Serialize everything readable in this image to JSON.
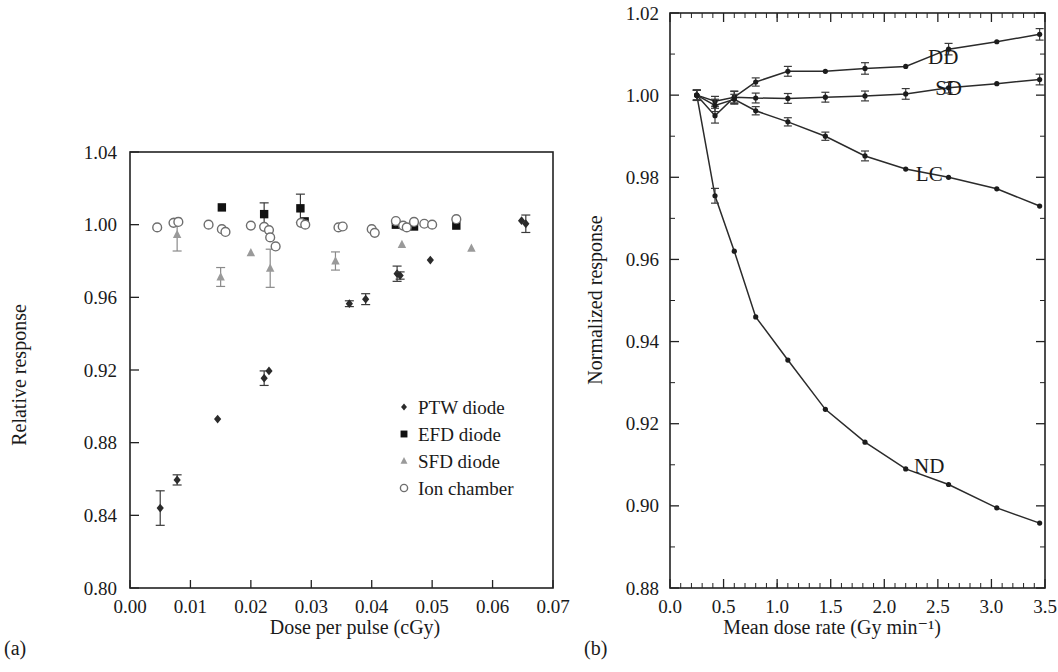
{
  "figure": {
    "panel_a_label": "(a)",
    "panel_b_label": "(b)"
  },
  "chart_data": [
    {
      "id": "panel-a",
      "type": "scatter",
      "title": "",
      "xlabel": "Dose per pulse (cGy)",
      "ylabel": "Relative response",
      "xlim": [
        0.0,
        0.07
      ],
      "ylim": [
        0.8,
        1.04
      ],
      "xticks": [
        0.0,
        0.01,
        0.02,
        0.03,
        0.04,
        0.05,
        0.06,
        0.07
      ],
      "xtick_labels": [
        "0.00",
        "0.01",
        "0.02",
        "0.03",
        "0.04",
        "0.05",
        "0.06",
        "0.07"
      ],
      "yticks": [
        0.8,
        0.84,
        0.88,
        0.92,
        0.96,
        1.0,
        1.04
      ],
      "ytick_labels": [
        "0.80",
        "0.84",
        "0.88",
        "0.92",
        "0.96",
        "1.00",
        "1.04"
      ],
      "grid": false,
      "legend_position": "inside lower-right",
      "legend": [
        {
          "label": "PTW diode",
          "marker": "filled-diamond",
          "color": "#2b2b2b"
        },
        {
          "label": "EFD diode",
          "marker": "filled-square",
          "color": "#111111"
        },
        {
          "label": "SFD diode",
          "marker": "filled-triangle",
          "color": "#9a9a9a"
        },
        {
          "label": "Ion chamber",
          "marker": "open-circle",
          "color": "#6e6e6e"
        }
      ],
      "series": [
        {
          "name": "PTW diode",
          "marker": "filled-diamond",
          "color": "#2b2b2b",
          "points": [
            {
              "x": 0.005,
              "y": 0.844,
              "yerr": 0.0095
            },
            {
              "x": 0.0078,
              "y": 0.8595,
              "yerr": 0.0028
            },
            {
              "x": 0.0145,
              "y": 0.893,
              "yerr": 0.0
            },
            {
              "x": 0.0222,
              "y": 0.9155,
              "yerr": 0.004
            },
            {
              "x": 0.023,
              "y": 0.9195,
              "yerr": 0.0
            },
            {
              "x": 0.0363,
              "y": 0.9565,
              "yerr": 0.0016
            },
            {
              "x": 0.039,
              "y": 0.959,
              "yerr": 0.003
            },
            {
              "x": 0.0442,
              "y": 0.973,
              "yerr": 0.0042
            },
            {
              "x": 0.0447,
              "y": 0.972,
              "yerr": 0.002
            },
            {
              "x": 0.0497,
              "y": 0.9805,
              "yerr": 0.0
            },
            {
              "x": 0.0648,
              "y": 1.0022,
              "yerr": 0.0
            },
            {
              "x": 0.0655,
              "y": 1.0005,
              "yerr": 0.0048
            }
          ]
        },
        {
          "name": "EFD diode",
          "marker": "filled-square",
          "color": "#111111",
          "points": [
            {
              "x": 0.0152,
              "y": 1.0095,
              "yerr": 0.0
            },
            {
              "x": 0.0222,
              "y": 1.0058,
              "yerr": 0.0062
            },
            {
              "x": 0.0282,
              "y": 1.009,
              "yerr": 0.0078
            },
            {
              "x": 0.0289,
              "y": 1.0018,
              "yerr": 0.0
            },
            {
              "x": 0.044,
              "y": 1.0,
              "yerr": 0.0
            },
            {
              "x": 0.047,
              "y": 0.999,
              "yerr": 0.0
            },
            {
              "x": 0.054,
              "y": 0.9995,
              "yerr": 0.0
            }
          ]
        },
        {
          "name": "SFD diode",
          "marker": "filled-triangle",
          "color": "#9a9a9a",
          "points": [
            {
              "x": 0.0078,
              "y": 0.9945,
              "yerr": 0.009
            },
            {
              "x": 0.015,
              "y": 0.9712,
              "yerr": 0.0052
            },
            {
              "x": 0.02,
              "y": 0.9845,
              "yerr": 0.0
            },
            {
              "x": 0.0232,
              "y": 0.976,
              "yerr": 0.0105
            },
            {
              "x": 0.034,
              "y": 0.98,
              "yerr": 0.005
            },
            {
              "x": 0.045,
              "y": 0.989,
              "yerr": 0.0
            },
            {
              "x": 0.0565,
              "y": 0.987,
              "yerr": 0.0
            }
          ]
        },
        {
          "name": "Ion chamber",
          "marker": "open-circle",
          "color": "#6e6e6e",
          "points": [
            {
              "x": 0.0045,
              "y": 0.9985,
              "yerr": 0.0
            },
            {
              "x": 0.0072,
              "y": 1.001,
              "yerr": 0.0
            },
            {
              "x": 0.008,
              "y": 1.0015,
              "yerr": 0.0
            },
            {
              "x": 0.013,
              "y": 1.0,
              "yerr": 0.0
            },
            {
              "x": 0.0152,
              "y": 0.9975,
              "yerr": 0.0
            },
            {
              "x": 0.0158,
              "y": 0.996,
              "yerr": 0.0
            },
            {
              "x": 0.02,
              "y": 0.9995,
              "yerr": 0.0
            },
            {
              "x": 0.0222,
              "y": 0.9988,
              "yerr": 0.0
            },
            {
              "x": 0.023,
              "y": 0.997,
              "yerr": 0.0
            },
            {
              "x": 0.0232,
              "y": 0.993,
              "yerr": 0.0
            },
            {
              "x": 0.0241,
              "y": 0.988,
              "yerr": 0.0
            },
            {
              "x": 0.0283,
              "y": 1.001,
              "yerr": 0.0
            },
            {
              "x": 0.029,
              "y": 1.0,
              "yerr": 0.0
            },
            {
              "x": 0.0345,
              "y": 0.9985,
              "yerr": 0.0
            },
            {
              "x": 0.0352,
              "y": 0.999,
              "yerr": 0.0
            },
            {
              "x": 0.04,
              "y": 0.9975,
              "yerr": 0.0
            },
            {
              "x": 0.0405,
              "y": 0.9955,
              "yerr": 0.0
            },
            {
              "x": 0.044,
              "y": 1.002,
              "yerr": 0.0
            },
            {
              "x": 0.0452,
              "y": 0.9995,
              "yerr": 0.0
            },
            {
              "x": 0.0458,
              "y": 0.9985,
              "yerr": 0.0
            },
            {
              "x": 0.047,
              "y": 1.0015,
              "yerr": 0.0
            },
            {
              "x": 0.0487,
              "y": 1.0005,
              "yerr": 0.0
            },
            {
              "x": 0.05,
              "y": 1.0,
              "yerr": 0.0
            },
            {
              "x": 0.054,
              "y": 1.003,
              "yerr": 0.0
            }
          ]
        }
      ]
    },
    {
      "id": "panel-b",
      "type": "line",
      "title": "",
      "xlabel": "Mean dose rate (Gy min⁻¹)",
      "ylabel": "Normalized response",
      "xlim": [
        0.0,
        3.5
      ],
      "ylim": [
        0.88,
        1.02
      ],
      "xticks": [
        0.0,
        0.5,
        1.0,
        1.5,
        2.0,
        2.5,
        3.0,
        3.5
      ],
      "xtick_labels": [
        "0.0",
        "0.5",
        "1.0",
        "1.5",
        "2.0",
        "2.5",
        "3.0",
        "3.5"
      ],
      "yticks": [
        0.88,
        0.9,
        0.92,
        0.94,
        0.96,
        0.98,
        1.0,
        1.02
      ],
      "ytick_labels": [
        "0.88",
        "0.90",
        "0.92",
        "0.94",
        "0.96",
        "0.98",
        "1.00",
        "1.02"
      ],
      "grid": false,
      "legend_position": "inline annotations",
      "series": [
        {
          "name": "DD",
          "label": "DD",
          "label_x": 2.55,
          "label_y": 1.0075,
          "points": [
            {
              "x": 0.25,
              "y": 1.0,
              "yerr": 0.0012
            },
            {
              "x": 0.42,
              "y": 0.995,
              "yerr": 0.0018
            },
            {
              "x": 0.6,
              "y": 0.9995,
              "yerr": 0.0015
            },
            {
              "x": 0.8,
              "y": 1.0032,
              "yerr": 0.001
            },
            {
              "x": 1.1,
              "y": 1.0058,
              "yerr": 0.0012
            },
            {
              "x": 1.45,
              "y": 1.0058,
              "yerr": 0.0
            },
            {
              "x": 1.82,
              "y": 1.0065,
              "yerr": 0.0014
            },
            {
              "x": 2.2,
              "y": 1.007,
              "yerr": 0.0
            },
            {
              "x": 2.6,
              "y": 1.0112,
              "yerr": 0.0014
            },
            {
              "x": 3.05,
              "y": 1.013,
              "yerr": 0.0
            },
            {
              "x": 3.45,
              "y": 1.0148,
              "yerr": 0.0014
            }
          ]
        },
        {
          "name": "SD",
          "label": "SD",
          "label_x": 2.6,
          "label_y": 1.0,
          "points": [
            {
              "x": 0.25,
              "y": 1.0,
              "yerr": 0.0013
            },
            {
              "x": 0.42,
              "y": 0.9985,
              "yerr": 0.0012
            },
            {
              "x": 0.6,
              "y": 0.9995,
              "yerr": 0.0014
            },
            {
              "x": 0.8,
              "y": 0.9993,
              "yerr": 0.0012
            },
            {
              "x": 1.1,
              "y": 0.9992,
              "yerr": 0.0012
            },
            {
              "x": 1.45,
              "y": 0.9995,
              "yerr": 0.0012
            },
            {
              "x": 1.82,
              "y": 0.9998,
              "yerr": 0.0012
            },
            {
              "x": 2.2,
              "y": 1.0003,
              "yerr": 0.0013
            },
            {
              "x": 2.6,
              "y": 1.0018,
              "yerr": 0.0013
            },
            {
              "x": 3.05,
              "y": 1.0028,
              "yerr": 0.0
            },
            {
              "x": 3.45,
              "y": 1.0038,
              "yerr": 0.0013
            }
          ]
        },
        {
          "name": "LC",
          "label": "LC",
          "label_x": 2.42,
          "label_y": 0.979,
          "points": [
            {
              "x": 0.25,
              "y": 1.0,
              "yerr": 0.0012
            },
            {
              "x": 0.42,
              "y": 0.9975,
              "yerr": 0.0015
            },
            {
              "x": 0.6,
              "y": 0.999,
              "yerr": 0.0012
            },
            {
              "x": 0.8,
              "y": 0.9962,
              "yerr": 0.001
            },
            {
              "x": 1.1,
              "y": 0.9935,
              "yerr": 0.001
            },
            {
              "x": 1.45,
              "y": 0.99,
              "yerr": 0.001
            },
            {
              "x": 1.82,
              "y": 0.9852,
              "yerr": 0.0012
            },
            {
              "x": 2.2,
              "y": 0.982,
              "yerr": 0.0
            },
            {
              "x": 2.6,
              "y": 0.98,
              "yerr": 0.0
            },
            {
              "x": 3.05,
              "y": 0.9772,
              "yerr": 0.0
            },
            {
              "x": 3.45,
              "y": 0.973,
              "yerr": 0.0
            }
          ]
        },
        {
          "name": "ND",
          "label": "ND",
          "label_x": 2.42,
          "label_y": 0.908,
          "points": [
            {
              "x": 0.25,
              "y": 1.0,
              "yerr": 0.0012
            },
            {
              "x": 0.42,
              "y": 0.9755,
              "yerr": 0.0018
            },
            {
              "x": 0.6,
              "y": 0.962,
              "yerr": 0.0
            },
            {
              "x": 0.8,
              "y": 0.946,
              "yerr": 0.0
            },
            {
              "x": 1.1,
              "y": 0.9355,
              "yerr": 0.0
            },
            {
              "x": 1.45,
              "y": 0.9235,
              "yerr": 0.0
            },
            {
              "x": 1.82,
              "y": 0.9155,
              "yerr": 0.0
            },
            {
              "x": 2.2,
              "y": 0.909,
              "yerr": 0.0
            },
            {
              "x": 2.6,
              "y": 0.9052,
              "yerr": 0.0
            },
            {
              "x": 3.05,
              "y": 0.8995,
              "yerr": 0.0
            },
            {
              "x": 3.45,
              "y": 0.8958,
              "yerr": 0.0
            }
          ]
        }
      ]
    }
  ]
}
